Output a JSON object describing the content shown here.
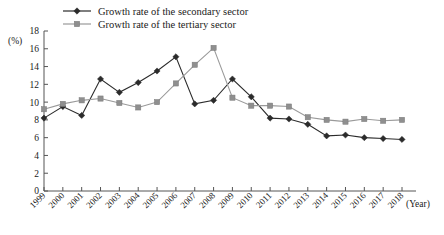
{
  "chart_data": {
    "type": "line",
    "title": "",
    "xlabel": "(Year)",
    "ylabel": "(%)",
    "ylim": [
      0,
      18
    ],
    "ytick_step": 2,
    "grid": false,
    "legend_position": "top-left",
    "categories": [
      "1999",
      "2000",
      "2001",
      "2002",
      "2003",
      "2004",
      "2005",
      "2006",
      "2007",
      "2008",
      "2009",
      "2010",
      "2011",
      "2012",
      "2013",
      "2014",
      "2015",
      "2016",
      "2017",
      "2018"
    ],
    "yticks": [
      "0",
      "2",
      "4",
      "6",
      "8",
      "10",
      "12",
      "14",
      "16",
      "18"
    ],
    "series": [
      {
        "name": "Growth rate of the secondary sector",
        "marker": "diamond",
        "color": "#2b2b2b",
        "values": [
          8.2,
          9.5,
          8.5,
          12.6,
          11.1,
          12.2,
          13.5,
          15.1,
          9.8,
          10.2,
          12.6,
          10.6,
          8.2,
          8.1,
          7.5,
          6.2,
          6.3,
          6.0,
          5.9,
          5.8
        ]
      },
      {
        "name": "Growth rate of the tertiary sector",
        "marker": "square",
        "color": "#8f8f8f",
        "values": [
          9.2,
          9.8,
          10.2,
          10.4,
          9.9,
          9.4,
          10.0,
          12.1,
          14.2,
          16.1,
          10.5,
          9.6,
          9.6,
          9.5,
          8.3,
          8.0,
          7.8,
          8.1,
          7.9,
          8.0
        ]
      }
    ]
  },
  "axis": {
    "y_unit": "(%)",
    "x_unit": "(Year)"
  }
}
